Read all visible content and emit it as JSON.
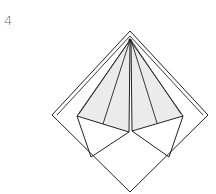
{
  "step": {
    "number": "4"
  },
  "diagram": {
    "colors": {
      "line": "#222222",
      "shade": "#ebebeb",
      "paper": "#ffffff",
      "number": "#6a6a6a"
    }
  }
}
